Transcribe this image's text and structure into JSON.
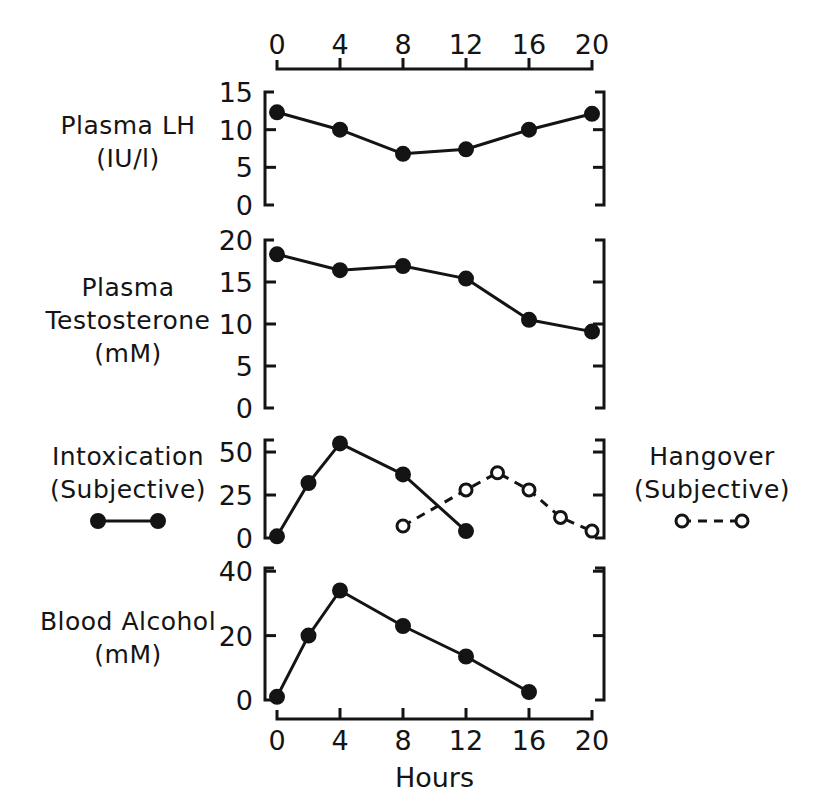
{
  "figure": {
    "title": "",
    "x_axis_title": "Hours",
    "x_ticks": [
      0,
      4,
      8,
      12,
      16,
      20
    ],
    "x_range": [
      0,
      20
    ]
  },
  "panels": {
    "lh": {
      "label_line1": "Plasma LH",
      "label_line2": "(IU/l)",
      "y_ticks": [
        0,
        5,
        10,
        15
      ],
      "y_range": [
        0,
        15
      ]
    },
    "testosterone": {
      "label_line1": "Plasma",
      "label_line2": "Testosterone",
      "label_line3": "(mM)",
      "y_ticks": [
        0,
        5,
        10,
        15,
        20
      ],
      "y_range": [
        0,
        20
      ]
    },
    "intoxication": {
      "label_line1": "Intoxication",
      "label_line2": "(Subjective)",
      "right_label_line1": "Hangover",
      "right_label_line2": "(Subjective)",
      "y_ticks": [
        0,
        25,
        50
      ],
      "y_range": [
        0,
        57
      ]
    },
    "alcohol": {
      "label_line1": "Blood Alcohol",
      "label_line2": "(mM)",
      "y_ticks": [
        0,
        20,
        40
      ],
      "y_range": [
        0,
        41
      ]
    }
  },
  "legend": {
    "intoxication_marker": "filled-circle-solid-line",
    "hangover_marker": "open-circle-dashed-line"
  },
  "colors": {
    "ink": "#141414",
    "background": "#ffffff"
  },
  "chart_data": [
    {
      "type": "line",
      "panel": "lh",
      "title": "Plasma LH (IU/l)",
      "xlabel": "Hours",
      "ylabel": "Plasma LH (IU/l)",
      "xlim": [
        0,
        20
      ],
      "ylim": [
        0,
        15
      ],
      "xticks": [
        0,
        4,
        8,
        12,
        16,
        20
      ],
      "yticks": [
        0,
        5,
        10,
        15
      ],
      "grid": false,
      "legend": "none",
      "series": [
        {
          "name": "Plasma LH",
          "marker": "filled-circle",
          "linestyle": "solid",
          "x": [
            0,
            4,
            8,
            12,
            16,
            20
          ],
          "values": [
            12.3,
            10.0,
            6.8,
            7.4,
            10.0,
            12.1
          ]
        }
      ]
    },
    {
      "type": "line",
      "panel": "testosterone",
      "title": "Plasma Testosterone (mM)",
      "xlabel": "Hours",
      "ylabel": "Plasma Testosterone (mM)",
      "xlim": [
        0,
        20
      ],
      "ylim": [
        0,
        20
      ],
      "xticks": [
        0,
        4,
        8,
        12,
        16,
        20
      ],
      "yticks": [
        0,
        5,
        10,
        15,
        20
      ],
      "grid": false,
      "legend": "none",
      "series": [
        {
          "name": "Plasma Testosterone",
          "marker": "filled-circle",
          "linestyle": "solid",
          "x": [
            0,
            4,
            8,
            12,
            16,
            20
          ],
          "values": [
            18.3,
            16.4,
            16.9,
            15.4,
            10.5,
            9.1
          ]
        }
      ]
    },
    {
      "type": "line",
      "panel": "intoxication",
      "title": "Intoxication / Hangover (Subjective)",
      "xlabel": "Hours",
      "ylabel": "Subjective score",
      "xlim": [
        0,
        20
      ],
      "ylim": [
        0,
        57
      ],
      "xticks": [
        0,
        4,
        8,
        12,
        16,
        20
      ],
      "yticks": [
        0,
        25,
        50
      ],
      "grid": false,
      "legend": "outside",
      "series": [
        {
          "name": "Intoxication (Subjective)",
          "marker": "filled-circle",
          "linestyle": "solid",
          "x": [
            0,
            2,
            4,
            8,
            12
          ],
          "values": [
            1,
            32,
            55,
            37,
            4
          ]
        },
        {
          "name": "Hangover (Subjective)",
          "marker": "open-circle",
          "linestyle": "dashed",
          "x": [
            8,
            12,
            14,
            16,
            18,
            20
          ],
          "values": [
            7,
            28,
            38,
            28,
            12,
            4
          ]
        }
      ]
    },
    {
      "type": "line",
      "panel": "alcohol",
      "title": "Blood Alcohol (mM)",
      "xlabel": "Hours",
      "ylabel": "Blood Alcohol (mM)",
      "xlim": [
        0,
        20
      ],
      "ylim": [
        0,
        41
      ],
      "xticks": [
        0,
        4,
        8,
        12,
        16,
        20
      ],
      "yticks": [
        0,
        20,
        40
      ],
      "grid": false,
      "legend": "none",
      "series": [
        {
          "name": "Blood Alcohol",
          "marker": "filled-circle",
          "linestyle": "solid",
          "x": [
            0,
            2,
            4,
            8,
            12,
            16
          ],
          "values": [
            1,
            20,
            34,
            23,
            13.5,
            2.5
          ]
        }
      ]
    }
  ]
}
